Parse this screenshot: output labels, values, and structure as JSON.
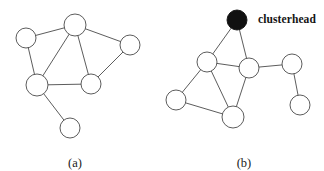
{
  "figure": {
    "background_color": "#ffffff",
    "node_stroke_color": "#4a4a4a",
    "node_fill_color": "#ffffff",
    "clusterhead_fill_color": "#111111",
    "edge_color": "#4a4a4a",
    "text_color": "#1a1a1a"
  },
  "annotations": {
    "clusterhead_label": "clusterhead"
  },
  "captions": {
    "left": "(a)",
    "right": "(b)"
  },
  "chart_data": {
    "type": "diagram",
    "subtype": "node-link-graph",
    "panels": [
      {
        "id": "a",
        "caption": "(a)",
        "caption_position": {
          "x": 75,
          "y": 157
        },
        "node_count": 6,
        "edge_count": 8,
        "nodes": [
          {
            "id": "a1",
            "x": 75,
            "y": 25,
            "r": 11,
            "fill": "white",
            "role": "plain-node"
          },
          {
            "id": "a2",
            "x": 26,
            "y": 38,
            "r": 10,
            "fill": "white",
            "role": "plain-node"
          },
          {
            "id": "a3",
            "x": 130,
            "y": 45,
            "r": 10,
            "fill": "white",
            "role": "plain-node"
          },
          {
            "id": "a4",
            "x": 37,
            "y": 85,
            "r": 11,
            "fill": "white",
            "role": "plain-node"
          },
          {
            "id": "a5",
            "x": 91,
            "y": 84,
            "r": 10,
            "fill": "white",
            "role": "plain-node"
          },
          {
            "id": "a6",
            "x": 70,
            "y": 128,
            "r": 10,
            "fill": "white",
            "role": "plain-node"
          }
        ],
        "edges": [
          {
            "from": "a1",
            "to": "a2"
          },
          {
            "from": "a1",
            "to": "a3"
          },
          {
            "from": "a1",
            "to": "a4"
          },
          {
            "from": "a1",
            "to": "a5"
          },
          {
            "from": "a2",
            "to": "a4"
          },
          {
            "from": "a3",
            "to": "a5"
          },
          {
            "from": "a4",
            "to": "a5"
          },
          {
            "from": "a4",
            "to": "a6"
          }
        ]
      },
      {
        "id": "b",
        "caption": "(b)",
        "caption_position": {
          "x": 244,
          "y": 157
        },
        "node_count": 7,
        "edge_count": 9,
        "nodes": [
          {
            "id": "b1",
            "x": 237,
            "y": 20,
            "r": 10,
            "fill": "black",
            "role": "clusterhead-node"
          },
          {
            "id": "b2",
            "x": 207,
            "y": 62,
            "r": 10,
            "fill": "white",
            "role": "plain-node"
          },
          {
            "id": "b3",
            "x": 249,
            "y": 68,
            "r": 10,
            "fill": "white",
            "role": "plain-node"
          },
          {
            "id": "b4",
            "x": 176,
            "y": 100,
            "r": 10,
            "fill": "white",
            "role": "plain-node"
          },
          {
            "id": "b5",
            "x": 233,
            "y": 117,
            "r": 11,
            "fill": "white",
            "role": "plain-node"
          },
          {
            "id": "b6",
            "x": 292,
            "y": 64,
            "r": 10,
            "fill": "white",
            "role": "plain-node"
          },
          {
            "id": "b7",
            "x": 300,
            "y": 105,
            "r": 10,
            "fill": "white",
            "role": "plain-node"
          }
        ],
        "edges": [
          {
            "from": "b1",
            "to": "b2"
          },
          {
            "from": "b1",
            "to": "b3"
          },
          {
            "from": "b2",
            "to": "b3"
          },
          {
            "from": "b2",
            "to": "b4"
          },
          {
            "from": "b2",
            "to": "b5"
          },
          {
            "from": "b3",
            "to": "b5"
          },
          {
            "from": "b3",
            "to": "b6"
          },
          {
            "from": "b4",
            "to": "b5"
          },
          {
            "from": "b6",
            "to": "b7"
          }
        ],
        "annotations": [
          {
            "text": "clusterhead",
            "x": 258,
            "y": 14,
            "anchor": "start",
            "target": "b1"
          }
        ]
      }
    ]
  }
}
